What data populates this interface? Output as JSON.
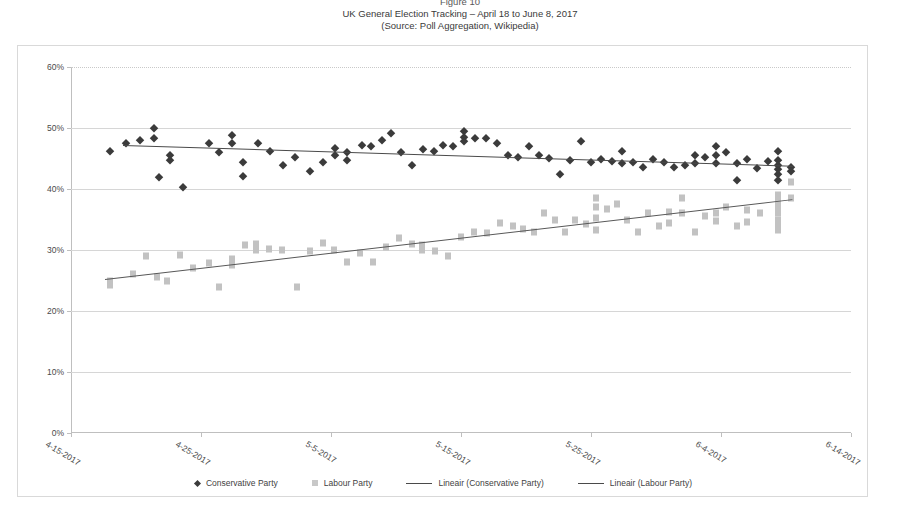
{
  "caption": {
    "figure": "Figure 10",
    "line1": "UK General Election Tracking – April 18 to June 8, 2017",
    "line2": "(Source: Poll Aggregation, Wikipedia)"
  },
  "colors": {
    "conservative": "#3b3b3b",
    "labour": "#c2c2c2",
    "trend_conservative": "#4a4a4a",
    "trend_labour": "#585858",
    "grid": "#d6d6d6",
    "frame": "#d9d9d9"
  },
  "legend": {
    "position": "bottom",
    "items": [
      {
        "label": "Conservative Party",
        "marker": "diamond"
      },
      {
        "label": "Labour Party",
        "marker": "square"
      },
      {
        "label": "Lineair (Conservative Party)",
        "marker": "line"
      },
      {
        "label": "Lineair (Labour Party)",
        "marker": "line"
      }
    ]
  },
  "chart_data": {
    "type": "scatter",
    "title": "UK General Election Tracking – April 18 to June 8, 2017",
    "subtitle": "(Source: Poll Aggregation, Wikipedia)",
    "xlabel": "",
    "ylabel": "",
    "grid": true,
    "ylim": [
      0,
      60
    ],
    "yticks": [
      "0%",
      "10%",
      "20%",
      "30%",
      "40%",
      "50%",
      "60%"
    ],
    "ytick_values": [
      0,
      10,
      20,
      30,
      40,
      50,
      60
    ],
    "xlim": [
      "4-15-2017",
      "6-14-2017"
    ],
    "xticks": [
      "4-15-2017",
      "4-25-2017",
      "5-5-2017",
      "5-15-2017",
      "5-25-2017",
      "6-4-2017",
      "6-14-2017"
    ],
    "xtick_days": [
      0,
      10,
      20,
      30,
      40,
      50,
      60
    ],
    "series": [
      {
        "name": "Conservative Party",
        "marker": "diamond",
        "points": [
          [
            3.0,
            46.3
          ],
          [
            4.2,
            47.5
          ],
          [
            5.3,
            48.0
          ],
          [
            6.4,
            50.0
          ],
          [
            6.4,
            48.3
          ],
          [
            6.8,
            42.0
          ],
          [
            7.6,
            45.5
          ],
          [
            7.6,
            44.7
          ],
          [
            8.6,
            40.3
          ],
          [
            10.6,
            47.5
          ],
          [
            11.4,
            46.0
          ],
          [
            12.4,
            48.8
          ],
          [
            12.4,
            47.6
          ],
          [
            13.2,
            44.5
          ],
          [
            13.2,
            42.2
          ],
          [
            14.4,
            47.5
          ],
          [
            15.3,
            46.3
          ],
          [
            16.3,
            44.0
          ],
          [
            17.2,
            45.2
          ],
          [
            18.4,
            43.0
          ],
          [
            19.4,
            44.5
          ],
          [
            20.3,
            46.8
          ],
          [
            20.3,
            45.6
          ],
          [
            21.2,
            46.0
          ],
          [
            21.2,
            44.8
          ],
          [
            22.4,
            47.2
          ],
          [
            23.1,
            47.1
          ],
          [
            23.9,
            48.0
          ],
          [
            24.6,
            49.2
          ],
          [
            25.4,
            46.0
          ],
          [
            26.2,
            44.0
          ],
          [
            27.1,
            46.5
          ],
          [
            27.9,
            46.2
          ],
          [
            28.6,
            47.2
          ],
          [
            29.4,
            47.0
          ],
          [
            30.2,
            49.5
          ],
          [
            30.2,
            48.5
          ],
          [
            30.2,
            47.8
          ],
          [
            31.1,
            48.4
          ],
          [
            31.9,
            48.3
          ],
          [
            32.8,
            47.5
          ],
          [
            33.6,
            45.6
          ],
          [
            34.4,
            45.2
          ],
          [
            35.2,
            47.0
          ],
          [
            36.0,
            45.5
          ],
          [
            36.8,
            45.1
          ],
          [
            37.6,
            42.4
          ],
          [
            38.4,
            44.8
          ],
          [
            39.2,
            47.8
          ],
          [
            40.0,
            44.5
          ],
          [
            40.8,
            45.0
          ],
          [
            41.6,
            44.6
          ],
          [
            42.4,
            46.3
          ],
          [
            42.4,
            44.2
          ],
          [
            43.2,
            44.4
          ],
          [
            44.0,
            43.6
          ],
          [
            44.8,
            45.0
          ],
          [
            45.6,
            44.5
          ],
          [
            46.4,
            43.6
          ],
          [
            47.2,
            44.0
          ],
          [
            48.0,
            45.6
          ],
          [
            48.0,
            44.2
          ],
          [
            48.8,
            45.2
          ],
          [
            49.6,
            47.0
          ],
          [
            49.6,
            45.5
          ],
          [
            49.6,
            44.3
          ],
          [
            50.4,
            46.0
          ],
          [
            51.2,
            44.3
          ],
          [
            51.2,
            41.5
          ],
          [
            52.0,
            45.0
          ],
          [
            52.8,
            43.5
          ],
          [
            53.6,
            44.6
          ],
          [
            54.4,
            46.3
          ],
          [
            54.4,
            44.8
          ],
          [
            54.4,
            44.0
          ],
          [
            54.4,
            43.3
          ],
          [
            54.4,
            42.5
          ],
          [
            54.4,
            41.4
          ],
          [
            55.4,
            43.6
          ],
          [
            55.4,
            43.0
          ]
        ]
      },
      {
        "name": "Labour Party",
        "marker": "square",
        "points": [
          [
            3.0,
            25.0
          ],
          [
            3.0,
            24.2
          ],
          [
            4.8,
            26.0
          ],
          [
            5.8,
            29.0
          ],
          [
            6.6,
            25.5
          ],
          [
            7.4,
            25.0
          ],
          [
            8.4,
            29.2
          ],
          [
            9.4,
            27.0
          ],
          [
            10.6,
            27.8
          ],
          [
            11.4,
            24.0
          ],
          [
            12.4,
            28.5
          ],
          [
            12.4,
            27.5
          ],
          [
            13.4,
            30.8
          ],
          [
            14.2,
            31.0
          ],
          [
            14.2,
            30.0
          ],
          [
            15.2,
            30.2
          ],
          [
            16.2,
            30.0
          ],
          [
            17.4,
            24.0
          ],
          [
            18.4,
            29.8
          ],
          [
            19.4,
            31.2
          ],
          [
            20.2,
            30.0
          ],
          [
            21.2,
            28.0
          ],
          [
            22.2,
            29.5
          ],
          [
            23.2,
            28.0
          ],
          [
            24.2,
            30.5
          ],
          [
            25.2,
            32.0
          ],
          [
            26.2,
            31.0
          ],
          [
            27.0,
            30.8
          ],
          [
            27.0,
            30.0
          ],
          [
            28.0,
            29.8
          ],
          [
            29.0,
            29.0
          ],
          [
            30.0,
            32.2
          ],
          [
            31.0,
            33.0
          ],
          [
            32.0,
            32.8
          ],
          [
            33.0,
            34.5
          ],
          [
            34.0,
            34.0
          ],
          [
            34.8,
            33.5
          ],
          [
            35.6,
            33.0
          ],
          [
            36.4,
            36.0
          ],
          [
            37.2,
            35.0
          ],
          [
            38.0,
            33.0
          ],
          [
            38.8,
            35.0
          ],
          [
            39.6,
            34.2
          ],
          [
            40.4,
            38.5
          ],
          [
            40.4,
            37.0
          ],
          [
            40.4,
            35.2
          ],
          [
            40.4,
            33.3
          ],
          [
            41.2,
            36.8
          ],
          [
            42.0,
            37.6
          ],
          [
            42.8,
            35.0
          ],
          [
            43.6,
            33.0
          ],
          [
            44.4,
            36.0
          ],
          [
            45.2,
            34.0
          ],
          [
            46.0,
            36.2
          ],
          [
            46.0,
            34.5
          ],
          [
            47.0,
            38.5
          ],
          [
            47.0,
            36.0
          ],
          [
            48.0,
            33.0
          ],
          [
            48.8,
            35.6
          ],
          [
            49.6,
            36.0
          ],
          [
            49.6,
            34.8
          ],
          [
            50.4,
            37.0
          ],
          [
            51.2,
            34.0
          ],
          [
            52.0,
            36.5
          ],
          [
            52.0,
            34.6
          ],
          [
            53.0,
            36.0
          ],
          [
            54.4,
            39.0
          ],
          [
            54.4,
            38.0
          ],
          [
            54.4,
            37.0
          ],
          [
            54.4,
            36.0
          ],
          [
            54.4,
            35.0
          ],
          [
            54.4,
            34.0
          ],
          [
            54.4,
            33.2
          ],
          [
            55.4,
            41.2
          ],
          [
            55.4,
            38.6
          ]
        ]
      }
    ],
    "trendlines": [
      {
        "name": "Lineair (Conservative Party)",
        "x0": 4.0,
        "y0": 47.2,
        "x1": 55.5,
        "y1": 43.8
      },
      {
        "name": "Lineair (Labour Party)",
        "x0": 2.6,
        "y0": 25.2,
        "x1": 55.5,
        "y1": 38.3
      }
    ]
  }
}
